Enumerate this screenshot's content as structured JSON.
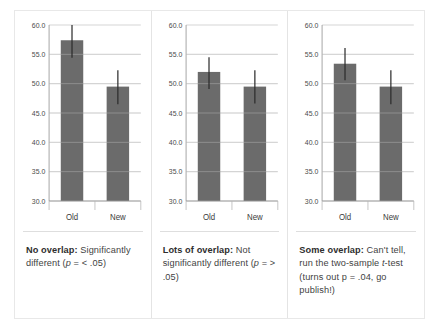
{
  "figure": {
    "panels": [
      {
        "id": "panel-no-overlap",
        "caption": {
          "lead": "No overlap:",
          "rest": " Significantly different (",
          "italic": "p",
          "tail": " = < .05)"
        },
        "chart_data": {
          "type": "bar",
          "categories": [
            "Old",
            "New"
          ],
          "values": [
            57.4,
            49.5
          ],
          "error_low": [
            54.4,
            46.5
          ],
          "error_high": [
            60.0,
            52.3
          ],
          "title": "",
          "xlabel": "",
          "ylabel": "",
          "ylim": [
            30.0,
            60.0
          ],
          "yticks": [
            60.0,
            55.0,
            50.0,
            45.0,
            40.0,
            35.0,
            30.0
          ],
          "ytick_labels": [
            "60.0",
            "55.0",
            "50.0",
            "45.0",
            "40.0",
            "35.0",
            "30.0"
          ],
          "grid": true,
          "legend": "none",
          "bar_color": "#6b6b6b",
          "error_color": "#2b2b2b",
          "grid_color": "#c9c9c9"
        }
      },
      {
        "id": "panel-lots-overlap",
        "caption": {
          "lead": "Lots of overlap:",
          "rest": " Not significantly different (",
          "italic": "p",
          "tail": " = > .05)"
        },
        "chart_data": {
          "type": "bar",
          "categories": [
            "Old",
            "New"
          ],
          "values": [
            52.0,
            49.5
          ],
          "error_low": [
            49.1,
            46.6
          ],
          "error_high": [
            54.5,
            52.3
          ],
          "title": "",
          "xlabel": "",
          "ylabel": "",
          "ylim": [
            30.0,
            60.0
          ],
          "yticks": [
            60.0,
            55.0,
            50.0,
            45.0,
            40.0,
            35.0,
            30.0
          ],
          "ytick_labels": [
            "60.0",
            "55.0",
            "50.0",
            "45.0",
            "40.0",
            "35.0",
            "30.0"
          ],
          "grid": true,
          "legend": "none",
          "bar_color": "#6b6b6b",
          "error_color": "#2b2b2b",
          "grid_color": "#c9c9c9"
        }
      },
      {
        "id": "panel-some-overlap",
        "caption": {
          "lead": "Some overlap:",
          "rest": " Can't tell, run the two-sample ",
          "italic": "t",
          "tail": "-test (turns out p = .04, go publish!)"
        },
        "chart_data": {
          "type": "bar",
          "categories": [
            "Old",
            "New"
          ],
          "values": [
            53.4,
            49.5
          ],
          "error_low": [
            50.6,
            46.5
          ],
          "error_high": [
            56.1,
            52.3
          ],
          "title": "",
          "xlabel": "",
          "ylabel": "",
          "ylim": [
            30.0,
            60.0
          ],
          "yticks": [
            60.0,
            55.0,
            50.0,
            45.0,
            40.0,
            35.0,
            30.0
          ],
          "ytick_labels": [
            "60.0",
            "55.0",
            "50.0",
            "45.0",
            "40.0",
            "35.0",
            "30.0"
          ],
          "grid": true,
          "legend": "none",
          "bar_color": "#6b6b6b",
          "error_color": "#2b2b2b",
          "grid_color": "#c9c9c9"
        }
      }
    ]
  }
}
